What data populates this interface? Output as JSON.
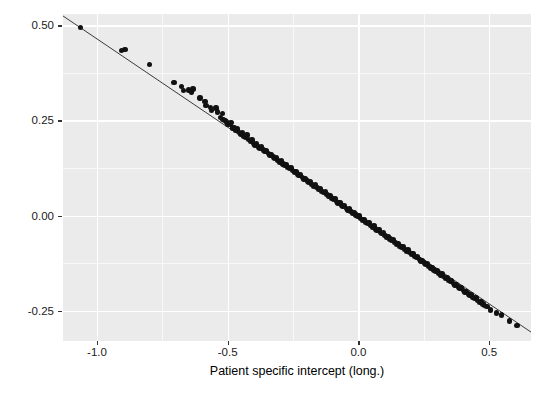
{
  "figure": {
    "background": "#ffffff",
    "panel_background": "#ebebeb",
    "gridline_color": "#ffffff",
    "point_color": "#111111",
    "line_color": "#3a3a3a"
  },
  "chart_data": {
    "type": "scatter",
    "title": "",
    "subtitle": "",
    "xlabel": "Patient specific intercept (long.)",
    "ylabel": "Patient specific intercept (surv.)",
    "xlim": [
      -1.13,
      0.66
    ],
    "ylim": [
      -0.33,
      0.53
    ],
    "xticks": [
      -1.0,
      -0.5,
      0.0,
      0.5
    ],
    "xticklabels": [
      "-1.0",
      "-0.5",
      "0.0",
      "0.5"
    ],
    "yticks": [
      -0.25,
      0.0,
      0.25,
      0.5
    ],
    "yticklabels": [
      "-0.25",
      "0.00",
      "0.25",
      "0.50"
    ],
    "x_minor_ticks": [
      -0.75,
      -0.25,
      0.25
    ],
    "y_minor_ticks": [
      -0.125,
      0.125,
      0.375
    ],
    "grid": true,
    "legend": "none",
    "annotations": [],
    "trendline": {
      "type": "linear",
      "slope": -0.4645,
      "intercept": 0.0,
      "x_start": -1.13,
      "x_end": 0.66,
      "color": "#3a3a3a",
      "width": 1.0
    },
    "series": [
      {
        "name": "patients",
        "marker": "filled-circle",
        "size": 5.4,
        "color": "#111111",
        "points": [
          [
            -1.062,
            0.494
          ],
          [
            -0.907,
            0.434
          ],
          [
            -0.893,
            0.436
          ],
          [
            -0.8,
            0.398
          ],
          [
            -0.706,
            0.35
          ],
          [
            -0.676,
            0.339
          ],
          [
            -0.669,
            0.329
          ],
          [
            -0.651,
            0.33
          ],
          [
            -0.638,
            0.325
          ],
          [
            -0.633,
            0.333
          ],
          [
            -0.606,
            0.309
          ],
          [
            -0.587,
            0.3
          ],
          [
            -0.583,
            0.289
          ],
          [
            -0.566,
            0.284
          ],
          [
            -0.561,
            0.276
          ],
          [
            -0.545,
            0.283
          ],
          [
            -0.54,
            0.272
          ],
          [
            -0.527,
            0.258
          ],
          [
            -0.521,
            0.268
          ],
          [
            -0.518,
            0.252
          ],
          [
            -0.51,
            0.25
          ],
          [
            -0.505,
            0.246
          ],
          [
            -0.5,
            0.241
          ],
          [
            -0.492,
            0.239
          ],
          [
            -0.487,
            0.245
          ],
          [
            -0.481,
            0.23
          ],
          [
            -0.473,
            0.232
          ],
          [
            -0.468,
            0.224
          ],
          [
            -0.463,
            0.228
          ],
          [
            -0.456,
            0.219
          ],
          [
            -0.449,
            0.214
          ],
          [
            -0.444,
            0.218
          ],
          [
            -0.438,
            0.208
          ],
          [
            -0.431,
            0.205
          ],
          [
            -0.426,
            0.212
          ],
          [
            -0.42,
            0.2
          ],
          [
            -0.413,
            0.196
          ],
          [
            -0.407,
            0.199
          ],
          [
            -0.401,
            0.19
          ],
          [
            -0.395,
            0.186
          ],
          [
            -0.389,
            0.189
          ],
          [
            -0.382,
            0.18
          ],
          [
            -0.376,
            0.177
          ],
          [
            -0.37,
            0.181
          ],
          [
            -0.364,
            0.172
          ],
          [
            -0.357,
            0.168
          ],
          [
            -0.351,
            0.17
          ],
          [
            -0.345,
            0.163
          ],
          [
            -0.339,
            0.159
          ],
          [
            -0.333,
            0.161
          ],
          [
            -0.326,
            0.154
          ],
          [
            -0.32,
            0.15
          ],
          [
            -0.314,
            0.152
          ],
          [
            -0.308,
            0.145
          ],
          [
            -0.301,
            0.141
          ],
          [
            -0.295,
            0.143
          ],
          [
            -0.289,
            0.136
          ],
          [
            -0.283,
            0.132
          ],
          [
            -0.277,
            0.134
          ],
          [
            -0.27,
            0.127
          ],
          [
            -0.264,
            0.123
          ],
          [
            -0.258,
            0.125
          ],
          [
            -0.252,
            0.118
          ],
          [
            -0.245,
            0.114
          ],
          [
            -0.239,
            0.116
          ],
          [
            -0.233,
            0.109
          ],
          [
            -0.227,
            0.105
          ],
          [
            -0.221,
            0.107
          ],
          [
            -0.214,
            0.1
          ],
          [
            -0.208,
            0.096
          ],
          [
            -0.202,
            0.098
          ],
          [
            -0.196,
            0.091
          ],
          [
            -0.19,
            0.087
          ],
          [
            -0.183,
            0.089
          ],
          [
            -0.177,
            0.082
          ],
          [
            -0.171,
            0.078
          ],
          [
            -0.165,
            0.08
          ],
          [
            -0.158,
            0.073
          ],
          [
            -0.152,
            0.069
          ],
          [
            -0.146,
            0.071
          ],
          [
            -0.14,
            0.064
          ],
          [
            -0.134,
            0.06
          ],
          [
            -0.127,
            0.062
          ],
          [
            -0.121,
            0.055
          ],
          [
            -0.115,
            0.051
          ],
          [
            -0.109,
            0.053
          ],
          [
            -0.102,
            0.046
          ],
          [
            -0.096,
            0.042
          ],
          [
            -0.09,
            0.044
          ],
          [
            -0.084,
            0.037
          ],
          [
            -0.078,
            0.033
          ],
          [
            -0.071,
            0.035
          ],
          [
            -0.065,
            0.028
          ],
          [
            -0.059,
            0.024
          ],
          [
            -0.053,
            0.026
          ],
          [
            -0.046,
            0.019
          ],
          [
            -0.04,
            0.015
          ],
          [
            -0.034,
            0.017
          ],
          [
            -0.028,
            0.01
          ],
          [
            -0.022,
            0.006
          ],
          [
            -0.015,
            0.008
          ],
          [
            -0.009,
            0.001
          ],
          [
            -0.003,
            -0.003
          ],
          [
            0.003,
            -0.001
          ],
          [
            0.009,
            -0.008
          ],
          [
            0.015,
            -0.012
          ],
          [
            0.022,
            -0.01
          ],
          [
            0.028,
            -0.017
          ],
          [
            0.034,
            -0.021
          ],
          [
            0.04,
            -0.019
          ],
          [
            0.046,
            -0.026
          ],
          [
            0.053,
            -0.03
          ],
          [
            0.059,
            -0.028
          ],
          [
            0.065,
            -0.035
          ],
          [
            0.071,
            -0.039
          ],
          [
            0.078,
            -0.037
          ],
          [
            0.084,
            -0.044
          ],
          [
            0.09,
            -0.048
          ],
          [
            0.096,
            -0.046
          ],
          [
            0.102,
            -0.053
          ],
          [
            0.109,
            -0.057
          ],
          [
            0.115,
            -0.055
          ],
          [
            0.121,
            -0.062
          ],
          [
            0.127,
            -0.066
          ],
          [
            0.134,
            -0.064
          ],
          [
            0.14,
            -0.071
          ],
          [
            0.146,
            -0.075
          ],
          [
            0.152,
            -0.073
          ],
          [
            0.158,
            -0.08
          ],
          [
            0.165,
            -0.084
          ],
          [
            0.171,
            -0.082
          ],
          [
            0.177,
            -0.089
          ],
          [
            0.183,
            -0.093
          ],
          [
            0.19,
            -0.091
          ],
          [
            0.196,
            -0.098
          ],
          [
            0.202,
            -0.102
          ],
          [
            0.208,
            -0.1
          ],
          [
            0.214,
            -0.107
          ],
          [
            0.221,
            -0.111
          ],
          [
            0.227,
            -0.109
          ],
          [
            0.233,
            -0.116
          ],
          [
            0.239,
            -0.12
          ],
          [
            0.245,
            -0.118
          ],
          [
            0.252,
            -0.125
          ],
          [
            0.258,
            -0.129
          ],
          [
            0.264,
            -0.127
          ],
          [
            0.27,
            -0.134
          ],
          [
            0.277,
            -0.138
          ],
          [
            0.283,
            -0.136
          ],
          [
            0.289,
            -0.143
          ],
          [
            0.295,
            -0.147
          ],
          [
            0.301,
            -0.145
          ],
          [
            0.308,
            -0.152
          ],
          [
            0.314,
            -0.156
          ],
          [
            0.32,
            -0.154
          ],
          [
            0.326,
            -0.161
          ],
          [
            0.333,
            -0.165
          ],
          [
            0.339,
            -0.163
          ],
          [
            0.345,
            -0.17
          ],
          [
            0.351,
            -0.174
          ],
          [
            0.357,
            -0.172
          ],
          [
            0.364,
            -0.179
          ],
          [
            0.37,
            -0.183
          ],
          [
            0.376,
            -0.181
          ],
          [
            0.382,
            -0.188
          ],
          [
            0.389,
            -0.192
          ],
          [
            0.395,
            -0.19
          ],
          [
            0.401,
            -0.197
          ],
          [
            0.407,
            -0.201
          ],
          [
            0.413,
            -0.199
          ],
          [
            0.42,
            -0.206
          ],
          [
            0.426,
            -0.21
          ],
          [
            0.431,
            -0.208
          ],
          [
            0.438,
            -0.215
          ],
          [
            0.444,
            -0.219
          ],
          [
            0.449,
            -0.217
          ],
          [
            0.456,
            -0.224
          ],
          [
            0.463,
            -0.228
          ],
          [
            0.468,
            -0.226
          ],
          [
            0.476,
            -0.233
          ],
          [
            0.481,
            -0.237
          ],
          [
            0.492,
            -0.24
          ],
          [
            0.505,
            -0.248
          ],
          [
            0.527,
            -0.256
          ],
          [
            0.548,
            -0.262
          ],
          [
            0.578,
            -0.277
          ],
          [
            0.607,
            -0.29
          ]
        ]
      }
    ]
  }
}
